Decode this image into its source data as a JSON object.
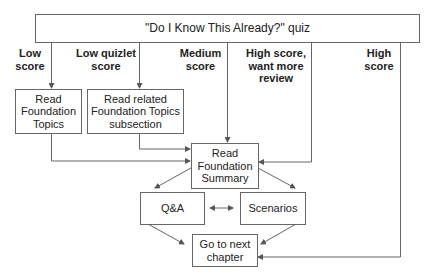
{
  "diagram": {
    "quiz_box": {
      "text": "\"Do I Know This Already?\" quiz"
    },
    "branch_labels": {
      "low": "Low\nscore",
      "low_quizlet": "Low quizlet\nscore",
      "medium": "Medium\nscore",
      "high_review": "High score,\nwant more\nreview",
      "high": "High\nscore"
    },
    "boxes": {
      "read_foundation_topics": "Read\nFoundation\nTopics",
      "read_related": "Read related\nFoundation Topics\nsubsection",
      "read_summary": "Read\nFoundation\nSummary",
      "qa": "Q&A",
      "scenarios": "Scenarios",
      "next_chapter": "Go to next\nchapter"
    },
    "colors": {
      "line": "#666666",
      "text": "#222222",
      "background": "#ffffff"
    }
  }
}
